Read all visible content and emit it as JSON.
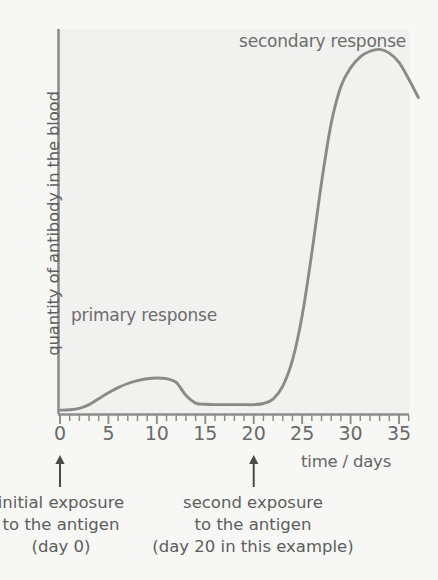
{
  "figure": {
    "background_color": "#f7f7f5",
    "plot_background_color": "#f1f1ef",
    "ink_color": "#8a8a8a",
    "text_color": "#5f5f5f"
  },
  "annotations": {
    "primary_response": "primary response",
    "secondary_response": "secondary response",
    "initial_exposure": {
      "line1": "initial exposure",
      "line2": "to the antigen",
      "line3": "(day 0)"
    },
    "second_exposure": {
      "line1": "second exposure",
      "line2": "to the antigen",
      "line3": "(day 20 in this example)"
    }
  },
  "markers": [
    {
      "name": "initial-exposure-arrow",
      "day": 0
    },
    {
      "name": "second-exposure-arrow",
      "day": 20
    }
  ],
  "chart_data": {
    "type": "line",
    "title": "",
    "xlabel": "time / days",
    "ylabel": "quantity of antibody in the blood",
    "xlim": [
      0,
      37
    ],
    "ylim": [
      0,
      100
    ],
    "grid": false,
    "legend": false,
    "x_ticks_major": [
      0,
      5,
      10,
      15,
      20,
      25,
      30,
      35
    ],
    "x_tick_labels": [
      "0",
      "5",
      "10",
      "15",
      "20",
      "25",
      "30",
      "35"
    ],
    "x_tick_minor_interval": 1,
    "y_ticks": [],
    "y_tick_labels": [],
    "series": [
      {
        "name": "antibody concentration",
        "color": "#8a8a8a",
        "x": [
          0,
          1,
          2,
          3,
          4,
          5,
          6,
          7,
          8,
          9,
          10,
          11,
          12,
          13,
          14,
          15,
          16,
          17,
          18,
          19,
          20,
          21,
          22,
          23,
          24,
          25,
          26,
          27,
          28,
          29,
          30,
          31,
          32,
          33,
          34,
          35,
          36,
          37
        ],
        "y": [
          0.5,
          0.6,
          1.0,
          2.0,
          3.6,
          5.2,
          6.6,
          7.7,
          8.5,
          9.0,
          9.2,
          9.0,
          8.0,
          4.5,
          2.4,
          2.1,
          2.0,
          2.0,
          2.0,
          2.0,
          2.0,
          2.3,
          3.5,
          7.0,
          14.0,
          26.0,
          43.0,
          62.0,
          78.0,
          88.0,
          93.0,
          96.0,
          97.5,
          98.0,
          97.0,
          94.5,
          90.0,
          85.0
        ]
      }
    ],
    "features": {
      "primary_peak_day": 10,
      "primary_peak_value": 9.2,
      "plateau_days": [
        15,
        21
      ],
      "plateau_value": 2.0,
      "secondary_rise_start_day": 22,
      "secondary_peak_day": 33,
      "secondary_peak_value": 98
    }
  }
}
